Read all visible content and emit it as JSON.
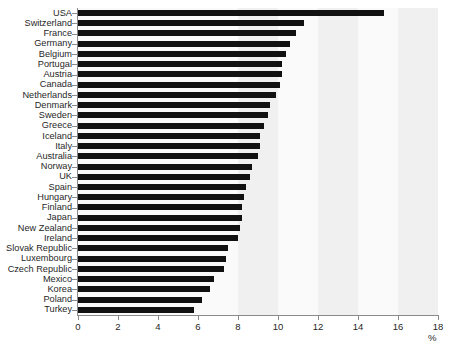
{
  "chart_data": {
    "type": "bar",
    "orientation": "horizontal",
    "title": "",
    "subtitle": "",
    "xlabel": "%",
    "ylabel": "",
    "xlim": [
      0,
      18
    ],
    "ylim": [
      0,
      30
    ],
    "xticks": [
      0,
      2,
      4,
      6,
      8,
      10,
      12,
      14,
      16,
      18
    ],
    "xtick_labels": [
      "0",
      "2",
      "4",
      "6",
      "8",
      "10",
      "12",
      "14",
      "16",
      "18"
    ],
    "grid": false,
    "legend": null,
    "bar_color": "#111111",
    "plot_background": "#fafafa",
    "band_color": "#f0f0f0",
    "axis_color": "#8a8a8a",
    "categories": [
      "USA",
      "Switzerland",
      "France",
      "Germany",
      "Belgium",
      "Portugal",
      "Austria",
      "Canada",
      "Netherlands",
      "Denmark",
      "Sweden",
      "Greece",
      "Iceland",
      "Italy",
      "Australia",
      "Norway",
      "UK",
      "Spain",
      "Hungary",
      "Finland",
      "Japan",
      "New Zealand",
      "Ireland",
      "Slovak Republic",
      "Luxembourg",
      "Czech Republic",
      "Mexico",
      "Korea",
      "Poland",
      "Turkey"
    ],
    "values": [
      15.3,
      11.3,
      10.9,
      10.6,
      10.4,
      10.2,
      10.2,
      10.1,
      9.9,
      9.6,
      9.5,
      9.3,
      9.1,
      9.1,
      9.0,
      8.7,
      8.6,
      8.4,
      8.3,
      8.2,
      8.2,
      8.1,
      8.0,
      7.5,
      7.4,
      7.3,
      6.8,
      6.6,
      6.2,
      5.8
    ],
    "background_bands": [
      {
        "from": 8.0,
        "to": 10.0
      },
      {
        "from": 12.0,
        "to": 14.0
      },
      {
        "from": 16.0,
        "to": 18.0
      }
    ]
  }
}
